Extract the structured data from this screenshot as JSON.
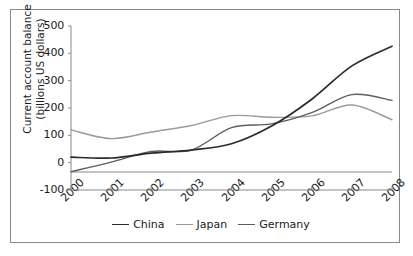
{
  "chart_data": {
    "type": "line",
    "title": "",
    "xlabel": "",
    "ylabel": "Current account balance (billions US dollars)",
    "ylabel_line1": "Current account balance",
    "ylabel_line2": "(billions US dollars)",
    "categories": [
      "2000",
      "2001",
      "2002",
      "2003",
      "2004",
      "2005",
      "2006",
      "2007",
      "2008"
    ],
    "x": [
      2000,
      2001,
      2002,
      2003,
      2004,
      2005,
      2006,
      2007,
      2008
    ],
    "ylim": [
      -100,
      500
    ],
    "yticks": [
      500,
      400,
      300,
      200,
      100,
      0,
      -100
    ],
    "ytick_labels": [
      "500",
      "400",
      "300",
      "200",
      "100",
      "0",
      "-100"
    ],
    "grid": false,
    "legend_position": "bottom",
    "series": [
      {
        "name": "China",
        "color": "#2b2b2b",
        "values": [
          20,
          17,
          35,
          46,
          69,
          134,
          232,
          354,
          426
        ]
      },
      {
        "name": "Japan",
        "color": "#9a9a9a",
        "values": [
          120,
          88,
          112,
          136,
          172,
          166,
          171,
          211,
          157
        ]
      },
      {
        "name": "Germany",
        "color": "#5e5e5e",
        "values": [
          -33,
          2,
          41,
          46,
          128,
          142,
          183,
          249,
          228
        ]
      }
    ]
  },
  "legend": {
    "items": [
      {
        "label": "China",
        "color": "#2b2b2b"
      },
      {
        "label": "Japan",
        "color": "#9a9a9a"
      },
      {
        "label": "Germany",
        "color": "#5e5e5e"
      }
    ]
  },
  "axes": {
    "y_tick_labels": [
      "500",
      "400",
      "300",
      "200",
      "100",
      "0",
      "-100"
    ],
    "x_tick_labels": [
      "2000",
      "2001",
      "2002",
      "2003",
      "2004",
      "2005",
      "2006",
      "2007",
      "2008"
    ]
  }
}
